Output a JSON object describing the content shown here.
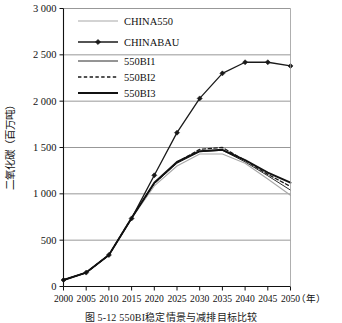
{
  "figure": {
    "caption": "图 5-12  550BI稳定情景与减排目标比较",
    "ylabel": "二氧化碳（百万吨）",
    "xunit": "（年）"
  },
  "chart_data": {
    "type": "line",
    "title": "",
    "xlabel": "（年）",
    "ylabel": "二氧化碳（百万吨）",
    "x": [
      2000,
      2005,
      2010,
      2015,
      2020,
      2025,
      2030,
      2035,
      2040,
      2045,
      2050
    ],
    "xlim": [
      2000,
      2050
    ],
    "ylim": [
      0,
      3000
    ],
    "yticks": [
      0,
      500,
      1000,
      1500,
      2000,
      2500,
      3000
    ],
    "ytick_labels": [
      "0",
      "500",
      "1 000",
      "1 500",
      "2 000",
      "2 500",
      "3 000"
    ],
    "xtick_labels": [
      "2000",
      "2005",
      "2010",
      "2015",
      "2020",
      "2025",
      "2030",
      "2035",
      "2040",
      "2045",
      "2050"
    ],
    "grid": "horizontal",
    "legend_position": "top-left",
    "series": [
      {
        "name": "CHINA550",
        "color": "#a8a8a8",
        "style": "solid",
        "width": 1.1,
        "marker": "none",
        "values": [
          70,
          150,
          340,
          735,
          1085,
          1300,
          1430,
          1430,
          1330,
          1160,
          985
        ]
      },
      {
        "name": "CHINABAU",
        "color": "#1a1a1a",
        "style": "solid",
        "width": 1.3,
        "marker": "diamond",
        "values": [
          70,
          150,
          340,
          735,
          1200,
          1660,
          2030,
          2300,
          2420,
          2420,
          2380
        ]
      },
      {
        "name": "550BI1",
        "color": "#2b2b2b",
        "style": "solid",
        "width": 1.0,
        "marker": "none",
        "values": [
          70,
          150,
          340,
          740,
          1110,
          1330,
          1455,
          1470,
          1345,
          1195,
          1040
        ]
      },
      {
        "name": "550BI2",
        "color": "#1a1a1a",
        "style": "dashed",
        "width": 1.3,
        "marker": "none",
        "values": [
          70,
          150,
          340,
          740,
          1115,
          1340,
          1480,
          1500,
          1360,
          1210,
          1080
        ]
      },
      {
        "name": "550BI3",
        "color": "#111111",
        "style": "solid",
        "width": 1.9,
        "marker": "none",
        "values": [
          70,
          150,
          340,
          740,
          1120,
          1345,
          1460,
          1475,
          1365,
          1230,
          1120
        ]
      }
    ]
  },
  "legend": {
    "items": [
      {
        "label": "CHINA550"
      },
      {
        "label": "CHINABAU"
      },
      {
        "label": "550BI1"
      },
      {
        "label": "550BI2"
      },
      {
        "label": "550BI3"
      }
    ]
  }
}
